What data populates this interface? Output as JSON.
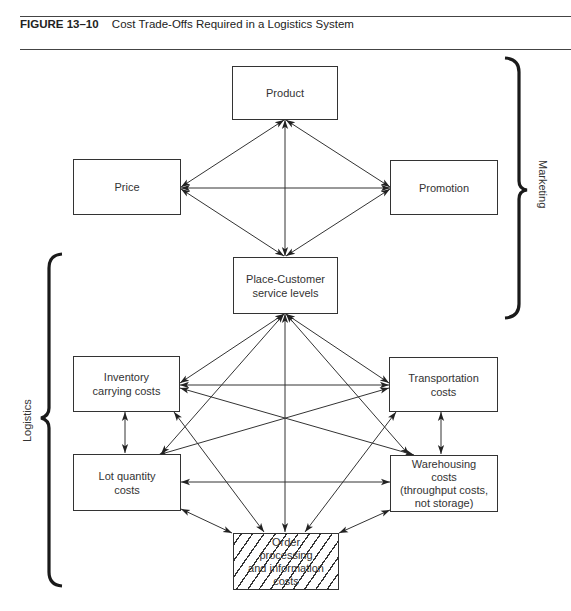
{
  "caption": {
    "figure_number": "FIGURE 13–10",
    "title": "Cost Trade-Offs Required in a Logistics System"
  },
  "nodes": {
    "product": "Product",
    "price": "Price",
    "promotion": "Promotion",
    "place": "Place-Customer\nservice levels",
    "inventory": "Inventory\ncarrying costs",
    "transportation": "Transportation\ncosts",
    "lot_quantity": "Lot quantity\ncosts",
    "warehousing": "Warehousing\ncosts\n(throughput costs,\nnot storage)",
    "order_processing": "Order\nprocessing\nand information\ncosts"
  },
  "groups": {
    "marketing": "Marketing",
    "logistics": "Logistics"
  },
  "edges": [
    [
      "product",
      "price"
    ],
    [
      "product",
      "promotion"
    ],
    [
      "product",
      "place"
    ],
    [
      "price",
      "promotion"
    ],
    [
      "price",
      "place"
    ],
    [
      "promotion",
      "place"
    ],
    [
      "place",
      "inventory"
    ],
    [
      "place",
      "transportation"
    ],
    [
      "place",
      "lot_quantity"
    ],
    [
      "place",
      "warehousing"
    ],
    [
      "place",
      "order_processing"
    ],
    [
      "inventory",
      "transportation"
    ],
    [
      "inventory",
      "warehousing"
    ],
    [
      "inventory",
      "lot_quantity"
    ],
    [
      "inventory",
      "order_processing"
    ],
    [
      "transportation",
      "lot_quantity"
    ],
    [
      "transportation",
      "warehousing"
    ],
    [
      "transportation",
      "order_processing"
    ],
    [
      "lot_quantity",
      "warehousing"
    ],
    [
      "lot_quantity",
      "order_processing"
    ],
    [
      "warehousing",
      "order_processing"
    ]
  ],
  "colors": {
    "line": "#333333",
    "background": "#ffffff"
  }
}
